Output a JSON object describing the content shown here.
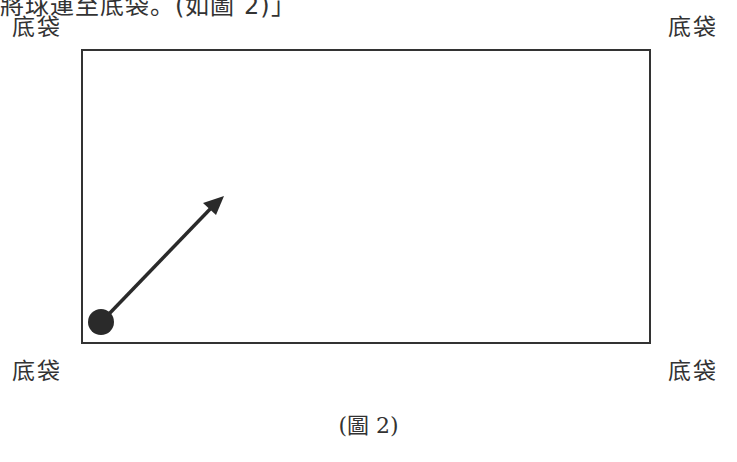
{
  "top_cut_text": "將球運至底袋。(如圖 2)」",
  "pockets": {
    "top_left": "底袋",
    "top_right": "底袋",
    "bottom_left": "底袋",
    "bottom_right": "底袋"
  },
  "ball": {
    "cx": 101,
    "cy": 322,
    "r": 13,
    "color": "#2a2a2a"
  },
  "arrow": {
    "x1": 108,
    "y1": 315,
    "x2": 222,
    "y2": 197,
    "color": "#2a2a2a"
  },
  "caption": "(圖 2)"
}
